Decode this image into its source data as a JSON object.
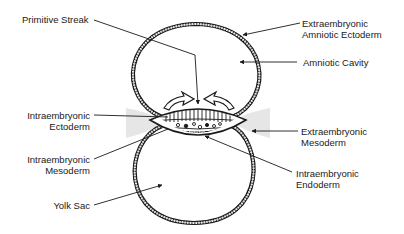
{
  "diagram": {
    "type": "anatomical-cross-section",
    "colors": {
      "line": "#1a1a1a",
      "background": "#ffffff",
      "membrane_fill": "#d8d8d8"
    },
    "labels": {
      "primitive_streak": {
        "line1": "Primitive Streak"
      },
      "extraembryonic_amniotic_ectoderm": {
        "line1": "Extraembryonic",
        "line2": "Amniotic Ectoderm"
      },
      "amniotic_cavity": {
        "line1": "Amniotic Cavity"
      },
      "intraembryonic_ectoderm": {
        "line1": "Intraembryonic",
        "line2": "Ectoderm"
      },
      "extraembryonic_mesoderm": {
        "line1": "Extraembryonic",
        "line2": "Mesoderm"
      },
      "intraembryonic_mesoderm": {
        "line1": "Intraembryonic",
        "line2": "Mesoderm"
      },
      "intraembryonic_endoderm": {
        "line1": "Intraembryonic",
        "line2": "Endoderm"
      },
      "yolk_sac": {
        "line1": "Yolk Sac"
      }
    }
  }
}
